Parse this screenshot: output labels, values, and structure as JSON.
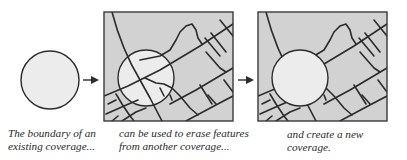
{
  "diagram": {
    "type": "process-flow",
    "colors": {
      "map_fill": "#d2d2d2",
      "circle_fill": "#ececec",
      "stroke": "#2b2b2b",
      "background": "#ffffff"
    },
    "panels": [
      {
        "id": "boundary-coverage",
        "shape": "circle",
        "caption_lines": [
          "The boundary of an",
          "existing coverage..."
        ]
      },
      {
        "id": "input-coverage-with-overlay",
        "shape": "map-with-circle-overlay",
        "caption_lines": [
          "can be used to erase features",
          "from another coverage..."
        ]
      },
      {
        "id": "output-coverage",
        "shape": "map-with-erased-circle",
        "caption_lines": [
          "and create a new",
          "coverage."
        ]
      }
    ],
    "arrows": [
      {
        "from": "boundary-coverage",
        "to": "input-coverage-with-overlay"
      },
      {
        "from": "input-coverage-with-overlay",
        "to": "output-coverage"
      }
    ]
  }
}
